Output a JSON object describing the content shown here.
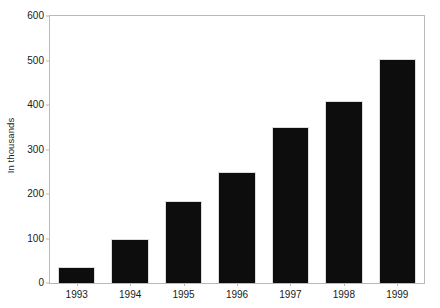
{
  "chart_data": {
    "type": "bar",
    "title": "",
    "xlabel": "",
    "ylabel": "In thousands",
    "categories": [
      "1993",
      "1994",
      "1995",
      "1996",
      "1997",
      "1998",
      "1999"
    ],
    "values": [
      35,
      100,
      185,
      250,
      350,
      410,
      503
    ],
    "ylim": [
      0,
      600
    ],
    "yticks": [
      0,
      100,
      200,
      300,
      400,
      500,
      600
    ],
    "ytick_labels": [
      "0",
      "100",
      "200",
      "300",
      "400",
      "500",
      "600"
    ],
    "grid": false,
    "legend": null,
    "bar_color": "#0d0d0d",
    "axis_color": "#b9b9b9",
    "text_color": "#1a1a1a",
    "background": "#ffffff"
  }
}
